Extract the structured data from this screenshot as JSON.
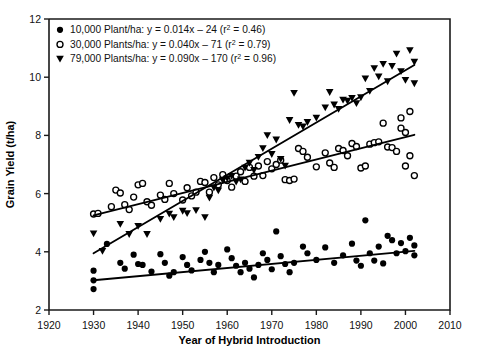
{
  "figure": {
    "caption_partial": ""
  },
  "chart_data": {
    "type": "scatter",
    "title": "",
    "xlabel": "Year of Hybrid Introduction",
    "ylabel": "Grain Yield (t/ha)",
    "xlim": [
      1920,
      2010
    ],
    "ylim": [
      2,
      12
    ],
    "xticks": [
      1920,
      1930,
      1940,
      1950,
      1960,
      1970,
      1980,
      1990,
      2000,
      2010
    ],
    "yticks": [
      2,
      4,
      6,
      8,
      10,
      12
    ],
    "grid": false,
    "legend_position": "top-left",
    "marker_colors": {
      "series1": "#000000",
      "series2": "#000000",
      "series3": "#000000"
    },
    "series": [
      {
        "name": "10,000 Plant/ha",
        "legend_label": "10,000 Plant/ha: y = 0.014x – 24 (r² = 0.46)",
        "density": "10,000",
        "marker": "filled-circle",
        "slope": 0.014,
        "intercept": -24,
        "r2": 0.46,
        "fit_x": [
          1930,
          2002
        ],
        "fit_y": [
          3.02,
          4.03
        ],
        "points": [
          [
            1930,
            3.35
          ],
          [
            1930,
            3.02
          ],
          [
            1930,
            2.72
          ],
          [
            1933,
            4.27
          ],
          [
            1936,
            3.62
          ],
          [
            1937,
            3.42
          ],
          [
            1939,
            3.9
          ],
          [
            1940,
            3.58
          ],
          [
            1941,
            3.55
          ],
          [
            1943,
            3.32
          ],
          [
            1945,
            3.92
          ],
          [
            1946,
            3.62
          ],
          [
            1947,
            3.18
          ],
          [
            1948,
            3.3
          ],
          [
            1950,
            3.82
          ],
          [
            1951,
            3.55
          ],
          [
            1952,
            3.36
          ],
          [
            1954,
            3.72
          ],
          [
            1955,
            4.0
          ],
          [
            1956,
            3.62
          ],
          [
            1957,
            3.3
          ],
          [
            1958,
            3.55
          ],
          [
            1960,
            4.08
          ],
          [
            1961,
            3.78
          ],
          [
            1962,
            3.52
          ],
          [
            1963,
            3.3
          ],
          [
            1964,
            3.62
          ],
          [
            1965,
            3.42
          ],
          [
            1966,
            3.12
          ],
          [
            1967,
            3.55
          ],
          [
            1968,
            3.95
          ],
          [
            1969,
            3.72
          ],
          [
            1970,
            3.4
          ],
          [
            1971,
            4.7
          ],
          [
            1972,
            3.85
          ],
          [
            1973,
            3.58
          ],
          [
            1974,
            3.3
          ],
          [
            1975,
            3.62
          ],
          [
            1977,
            4.18
          ],
          [
            1978,
            3.95
          ],
          [
            1980,
            3.72
          ],
          [
            1982,
            4.15
          ],
          [
            1984,
            3.62
          ],
          [
            1986,
            3.88
          ],
          [
            1988,
            4.28
          ],
          [
            1989,
            3.7
          ],
          [
            1990,
            3.52
          ],
          [
            1991,
            5.08
          ],
          [
            1992,
            3.95
          ],
          [
            1993,
            3.7
          ],
          [
            1994,
            4.18
          ],
          [
            1995,
            3.6
          ],
          [
            1996,
            4.55
          ],
          [
            1997,
            4.4
          ],
          [
            1998,
            3.95
          ],
          [
            1999,
            4.3
          ],
          [
            2000,
            4.02
          ],
          [
            2001,
            4.48
          ],
          [
            2002,
            4.22
          ],
          [
            2002,
            3.88
          ]
        ]
      },
      {
        "name": "30,000 Plants/ha",
        "legend_label": "30,000 Plants/ha: y = 0.040x – 71 (r² = 0.79)",
        "density": "30,000",
        "marker": "open-circle",
        "slope": 0.04,
        "intercept": -71,
        "r2": 0.79,
        "fit_x": [
          1930,
          2002
        ],
        "fit_y": [
          5.25,
          8.02
        ],
        "points": [
          [
            1930,
            5.3
          ],
          [
            1931,
            5.32
          ],
          [
            1934,
            5.55
          ],
          [
            1935,
            6.12
          ],
          [
            1936,
            6.02
          ],
          [
            1937,
            5.62
          ],
          [
            1938,
            5.45
          ],
          [
            1939,
            5.88
          ],
          [
            1940,
            6.3
          ],
          [
            1941,
            6.35
          ],
          [
            1942,
            5.72
          ],
          [
            1943,
            5.6
          ],
          [
            1945,
            5.95
          ],
          [
            1946,
            5.8
          ],
          [
            1947,
            6.35
          ],
          [
            1948,
            6.0
          ],
          [
            1950,
            5.78
          ],
          [
            1951,
            6.2
          ],
          [
            1952,
            5.92
          ],
          [
            1953,
            6.05
          ],
          [
            1954,
            6.42
          ],
          [
            1955,
            6.38
          ],
          [
            1956,
            6.05
          ],
          [
            1957,
            6.55
          ],
          [
            1958,
            6.3
          ],
          [
            1959,
            6.65
          ],
          [
            1960,
            6.45
          ],
          [
            1961,
            6.22
          ],
          [
            1962,
            6.6
          ],
          [
            1963,
            6.75
          ],
          [
            1964,
            6.42
          ],
          [
            1965,
            6.9
          ],
          [
            1966,
            6.6
          ],
          [
            1967,
            6.95
          ],
          [
            1968,
            6.62
          ],
          [
            1969,
            7.1
          ],
          [
            1970,
            6.85
          ],
          [
            1971,
            7.0
          ],
          [
            1972,
            7.15
          ],
          [
            1973,
            6.48
          ],
          [
            1974,
            6.45
          ],
          [
            1975,
            6.5
          ],
          [
            1976,
            7.55
          ],
          [
            1977,
            7.45
          ],
          [
            1978,
            7.25
          ],
          [
            1980,
            6.92
          ],
          [
            1982,
            7.4
          ],
          [
            1983,
            7.05
          ],
          [
            1984,
            6.9
          ],
          [
            1985,
            7.55
          ],
          [
            1986,
            7.48
          ],
          [
            1987,
            7.3
          ],
          [
            1988,
            7.72
          ],
          [
            1989,
            7.62
          ],
          [
            1990,
            6.88
          ],
          [
            1991,
            6.95
          ],
          [
            1992,
            7.7
          ],
          [
            1993,
            7.75
          ],
          [
            1994,
            7.78
          ],
          [
            1995,
            8.42
          ],
          [
            1996,
            7.6
          ],
          [
            1997,
            7.58
          ],
          [
            1998,
            7.45
          ],
          [
            1999,
            8.6
          ],
          [
            1999,
            8.25
          ],
          [
            2000,
            8.1
          ],
          [
            2000,
            6.95
          ],
          [
            2001,
            8.82
          ],
          [
            2001,
            7.3
          ],
          [
            2002,
            6.62
          ]
        ]
      },
      {
        "name": "79,000 Plants/ha",
        "legend_label": "79,000 Plants/ha: y = 0.090x – 170 (r² = 0.96)",
        "density": "79,000",
        "marker": "filled-triangle-down",
        "slope": 0.09,
        "intercept": -170,
        "r2": 0.96,
        "fit_x": [
          1930,
          2002
        ],
        "fit_y": [
          3.95,
          10.42
        ],
        "points": [
          [
            1930,
            4.62
          ],
          [
            1932,
            4.02
          ],
          [
            1936,
            4.95
          ],
          [
            1938,
            4.6
          ],
          [
            1940,
            4.88
          ],
          [
            1942,
            4.6
          ],
          [
            1945,
            5.12
          ],
          [
            1947,
            5.3
          ],
          [
            1948,
            5.18
          ],
          [
            1950,
            5.4
          ],
          [
            1951,
            5.32
          ],
          [
            1953,
            5.42
          ],
          [
            1955,
            5.18
          ],
          [
            1956,
            5.85
          ],
          [
            1957,
            6.2
          ],
          [
            1958,
            6.1
          ],
          [
            1959,
            6.45
          ],
          [
            1960,
            6.52
          ],
          [
            1961,
            6.6
          ],
          [
            1962,
            6.4
          ],
          [
            1963,
            6.48
          ],
          [
            1964,
            6.88
          ],
          [
            1965,
            7.05
          ],
          [
            1966,
            6.8
          ],
          [
            1967,
            7.25
          ],
          [
            1968,
            7.55
          ],
          [
            1969,
            8.0
          ],
          [
            1970,
            7.35
          ],
          [
            1971,
            7.85
          ],
          [
            1972,
            7.18
          ],
          [
            1973,
            6.95
          ],
          [
            1974,
            8.52
          ],
          [
            1975,
            9.45
          ],
          [
            1976,
            8.35
          ],
          [
            1977,
            8.3
          ],
          [
            1978,
            8.45
          ],
          [
            1980,
            8.6
          ],
          [
            1982,
            8.95
          ],
          [
            1983,
            9.48
          ],
          [
            1984,
            9.05
          ],
          [
            1985,
            8.9
          ],
          [
            1986,
            9.22
          ],
          [
            1987,
            9.18
          ],
          [
            1988,
            9.28
          ],
          [
            1989,
            9.1
          ],
          [
            1990,
            9.3
          ],
          [
            1991,
            9.95
          ],
          [
            1992,
            9.52
          ],
          [
            1993,
            10.3
          ],
          [
            1994,
            10.02
          ],
          [
            1995,
            10.45
          ],
          [
            1996,
            9.85
          ],
          [
            1997,
            10.38
          ],
          [
            1998,
            10.8
          ],
          [
            1999,
            10.2
          ],
          [
            2000,
            9.9
          ],
          [
            2001,
            10.92
          ],
          [
            2002,
            10.52
          ],
          [
            2002,
            9.78
          ]
        ]
      }
    ]
  }
}
